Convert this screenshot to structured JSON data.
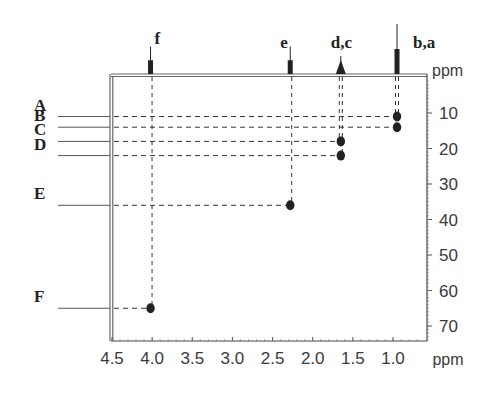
{
  "chart_data": {
    "type": "scatter",
    "subtype": "2D NMR correlation (HSQC-style) with 1D projection on top",
    "title": "",
    "xlabel": "ppm",
    "ylabel": "ppm",
    "xlim": [
      4.5,
      0.55
    ],
    "ylim": [
      0,
      75
    ],
    "x_reversed": true,
    "y_reversed": true,
    "x_ticks": [
      4.5,
      4.0,
      3.5,
      3.0,
      2.5,
      2.0,
      1.5,
      1.0
    ],
    "x_tick_labels": [
      "4.5",
      "4.0",
      "3.5",
      "3.0",
      "2.5",
      "2.0",
      "1.5",
      "1.0"
    ],
    "y_ticks": [
      10,
      20,
      30,
      40,
      50,
      60,
      70
    ],
    "y_tick_labels": [
      "10",
      "20",
      "30",
      "40",
      "50",
      "60",
      "70"
    ],
    "grid": false,
    "top_projection_peaks": [
      {
        "label": "f",
        "x": 4.02,
        "height": 0.55
      },
      {
        "label": "e",
        "x": 2.28,
        "height": 0.55
      },
      {
        "label": "d,c",
        "x": 1.65,
        "height": 0.35
      },
      {
        "label": "b,a",
        "x": 0.95,
        "height": 1.0
      }
    ],
    "cross_peaks": [
      {
        "row_label": "A",
        "x": 0.95,
        "y": 11
      },
      {
        "row_label": "B",
        "x": 0.95,
        "y": 14
      },
      {
        "row_label": "C",
        "x": 1.65,
        "y": 18
      },
      {
        "row_label": "D",
        "x": 1.65,
        "y": 22
      },
      {
        "row_label": "E",
        "x": 2.28,
        "y": 36
      },
      {
        "row_label": "F",
        "x": 4.02,
        "y": 65
      }
    ],
    "colors": {
      "ink": "#222222",
      "axis": "#555555",
      "dash": "#333333"
    }
  }
}
